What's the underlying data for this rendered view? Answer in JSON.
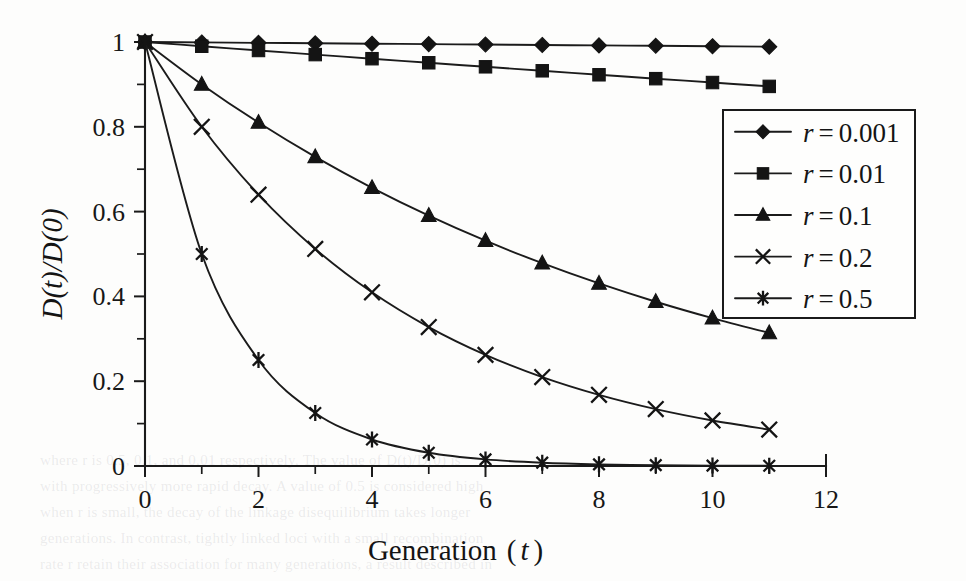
{
  "figure": {
    "background_color": "#fdfdfc",
    "ink_color": "#151515"
  },
  "bleed_text": [
    {
      "text": "where r is 0.5, 0.1, and 0.01 respectively. The value of D(t)/D(0) is",
      "x": 40,
      "y": 452
    },
    {
      "text": "with progressively more rapid decay. A value of 0.5 is considered high",
      "x": 40,
      "y": 478
    },
    {
      "text": "when r is small, the decay of the linkage disequilibrium takes longer",
      "x": 40,
      "y": 504
    },
    {
      "text": "generations. In contrast, tightly linked loci with a small recombination",
      "x": 40,
      "y": 530
    },
    {
      "text": "rate r retain their association for many generations, a result described in",
      "x": 40,
      "y": 556
    }
  ],
  "chart_data": {
    "type": "line",
    "title": "",
    "xlabel": "Generation ( t )",
    "xlabel_parts": {
      "main": "Generation",
      "open_paren": "(",
      "variable": "t",
      "close_paren": ")"
    },
    "ylabel": "D(t)/D(0)",
    "xlim": [
      0,
      12
    ],
    "ylim": [
      0,
      1
    ],
    "x_ticks": [
      0,
      2,
      4,
      6,
      8,
      10,
      12
    ],
    "x_tick_labels": [
      "0",
      "2",
      "4",
      "6",
      "8",
      "10",
      "12"
    ],
    "x_minor_step": 1,
    "y_ticks": [
      0,
      0.2,
      0.4,
      0.6,
      0.8,
      1
    ],
    "y_tick_labels": [
      "0",
      "0.2",
      "0.4",
      "0.6",
      "0.8",
      "1"
    ],
    "y_minor_step": 0.1,
    "grid": false,
    "legend_position": "right-middle",
    "x": [
      0,
      1,
      2,
      3,
      4,
      5,
      6,
      7,
      8,
      9,
      10,
      11
    ],
    "series": [
      {
        "name": "r = 0.001",
        "legend_label_variable": "r",
        "legend_label_equals": "=",
        "legend_label_value": "0.001",
        "marker": "diamond",
        "values": [
          1.0,
          0.999,
          0.998,
          0.997,
          0.996,
          0.995,
          0.994,
          0.993,
          0.992,
          0.991,
          0.99,
          0.989
        ]
      },
      {
        "name": "r = 0.01",
        "legend_label_variable": "r",
        "legend_label_equals": "=",
        "legend_label_value": "0.01",
        "marker": "square",
        "values": [
          1.0,
          0.99,
          0.98,
          0.9703,
          0.9606,
          0.951,
          0.9415,
          0.9321,
          0.9227,
          0.9135,
          0.9044,
          0.8953
        ]
      },
      {
        "name": "r = 0.1",
        "legend_label_variable": "r",
        "legend_label_equals": "=",
        "legend_label_value": "0.1",
        "marker": "triangle",
        "values": [
          1.0,
          0.9,
          0.81,
          0.729,
          0.6561,
          0.5905,
          0.5314,
          0.4783,
          0.4305,
          0.3874,
          0.3487,
          0.3138
        ]
      },
      {
        "name": "r = 0.2",
        "legend_label_variable": "r",
        "legend_label_equals": "=",
        "legend_label_value": "0.2",
        "marker": "cross",
        "values": [
          1.0,
          0.8,
          0.64,
          0.512,
          0.4096,
          0.3277,
          0.2621,
          0.2097,
          0.1678,
          0.1342,
          0.1074,
          0.0859
        ]
      },
      {
        "name": "r = 0.5",
        "legend_label_variable": "r",
        "legend_label_equals": "=",
        "legend_label_value": "0.5",
        "marker": "asterisk",
        "values": [
          1.0,
          0.5,
          0.25,
          0.125,
          0.0625,
          0.03125,
          0.015625,
          0.0078125,
          0.00390625,
          0.001953125,
          0.0009765625,
          0.00048828125
        ]
      }
    ]
  }
}
